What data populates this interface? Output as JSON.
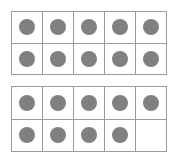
{
  "diagram": {
    "type": "ten-frames",
    "dot_color": "#808080",
    "border_color": "#9a9a9a",
    "background_color": "#ffffff",
    "frames": [
      {
        "name": "top-ten-frame",
        "filled_count": 10,
        "capacity": 10,
        "rows": [
          {
            "cells": [
              1,
              1,
              1,
              1,
              1
            ]
          },
          {
            "cells": [
              1,
              1,
              1,
              1,
              1
            ]
          }
        ]
      },
      {
        "name": "bottom-ten-frame",
        "filled_count": 9,
        "capacity": 10,
        "rows": [
          {
            "cells": [
              1,
              1,
              1,
              1,
              1
            ]
          },
          {
            "cells": [
              1,
              1,
              1,
              1,
              0
            ]
          }
        ]
      }
    ]
  }
}
